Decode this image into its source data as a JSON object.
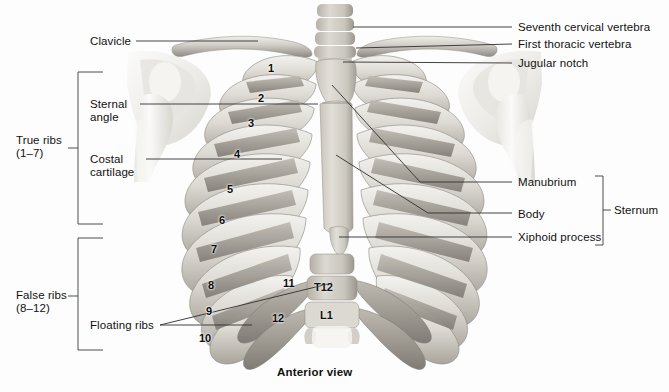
{
  "figure": {
    "caption": "Anterior view",
    "background_color": "#fdfdfd",
    "line_color": "#3a3a3a",
    "bone_light": "#efeeea",
    "bone_mid": "#cdcac3",
    "bone_dark": "#9c9890"
  },
  "labels_left": [
    {
      "id": "clavicle",
      "text": "Clavicle",
      "x": 90,
      "y": 35
    },
    {
      "id": "sternal-angle",
      "line1": "Sternal",
      "line2": "angle",
      "x": 90,
      "y": 98
    },
    {
      "id": "costal-cartilage",
      "line1": "Costal",
      "line2": "cartilage",
      "x": 90,
      "y": 153
    },
    {
      "id": "floating-ribs",
      "text": "Floating ribs",
      "x": 90,
      "y": 319
    }
  ],
  "labels_right": [
    {
      "id": "seventh-cervical-vertebra",
      "text": "Seventh cervical vertebra",
      "x": 518,
      "y": 21
    },
    {
      "id": "first-thoracic-vertebra",
      "text": "First thoracic vertebra",
      "x": 518,
      "y": 38
    },
    {
      "id": "jugular-notch",
      "text": "Jugular notch",
      "x": 518,
      "y": 57
    },
    {
      "id": "manubrium",
      "text": "Manubrium",
      "x": 518,
      "y": 176
    },
    {
      "id": "body",
      "text": "Body",
      "x": 518,
      "y": 208
    },
    {
      "id": "xiphoid-process",
      "text": "Xiphoid process",
      "x": 518,
      "y": 231
    }
  ],
  "brackets": [
    {
      "id": "true-ribs",
      "line1": "True ribs",
      "line2": "(1–7)",
      "label_x": 16,
      "label_y": 134
    },
    {
      "id": "false-ribs",
      "line1": "False ribs",
      "line2": "(8–12)",
      "label_x": 16,
      "label_y": 289
    },
    {
      "id": "sternum",
      "text": "Sternum",
      "label_x": 614,
      "label_y": 205
    }
  ],
  "rib_numbers": [
    {
      "n": "1",
      "x": 268,
      "y": 62
    },
    {
      "n": "2",
      "x": 258,
      "y": 92
    },
    {
      "n": "3",
      "x": 248,
      "y": 117
    },
    {
      "n": "4",
      "x": 234,
      "y": 148
    },
    {
      "n": "5",
      "x": 227,
      "y": 183
    },
    {
      "n": "6",
      "x": 219,
      "y": 214
    },
    {
      "n": "7",
      "x": 211,
      "y": 243
    },
    {
      "n": "8",
      "x": 208,
      "y": 279
    },
    {
      "n": "9",
      "x": 206,
      "y": 305
    },
    {
      "n": "10",
      "x": 204,
      "y": 332
    },
    {
      "n": "11",
      "x": 283,
      "y": 277
    },
    {
      "n": "12",
      "x": 272,
      "y": 312
    }
  ],
  "vertebra_labels": [
    {
      "id": "t12",
      "text": "T12",
      "x": 314,
      "y": 286
    },
    {
      "id": "l1",
      "text": "L1",
      "x": 320,
      "y": 314
    }
  ]
}
